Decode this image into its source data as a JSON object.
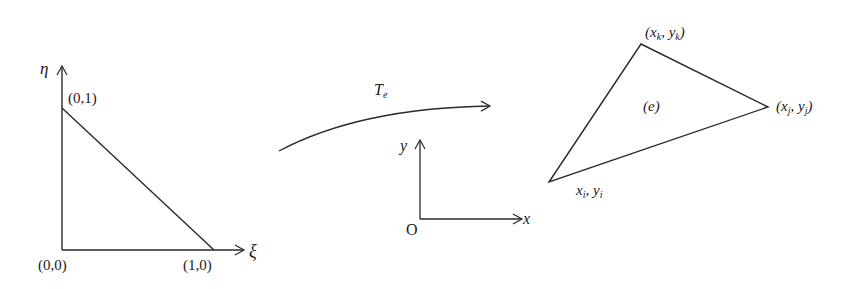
{
  "reference_element": {
    "axis_vertical": "η",
    "axis_horizontal": "ξ",
    "vertices": [
      "(0,0)",
      "(1,0)",
      "(0,1)"
    ]
  },
  "mapping": {
    "label": "T",
    "subscript": "e"
  },
  "global_axes": {
    "x_label": "x",
    "y_label": "y",
    "origin_label": "O"
  },
  "physical_element": {
    "label": "(e)",
    "vertex_i": {
      "x": "x",
      "xs": "i",
      "y": "y",
      "ys": "i"
    },
    "vertex_j": {
      "x": "x",
      "xs": "j",
      "y": "y",
      "ys": "j"
    },
    "vertex_k": {
      "x": "x",
      "xs": "k",
      "y": "y",
      "ys": "k"
    }
  },
  "colors": {
    "stroke": "#2a2a2a",
    "background": "#ffffff"
  }
}
